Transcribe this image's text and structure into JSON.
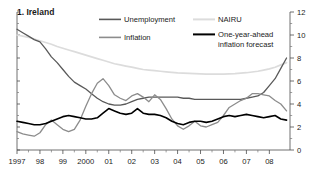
{
  "title": "1. Ireland",
  "legend": {
    "items": [
      {
        "label": "Unemployment",
        "color": "#595959",
        "width": 1.5
      },
      {
        "label": "Inflation",
        "color": "#8c8c8c",
        "width": 1.5
      },
      {
        "label": "NAIRU",
        "color": "#dcdcdc",
        "width": 1.6
      },
      {
        "label": "One-year-ahead",
        "color": "#000000",
        "width": 1.8
      },
      {
        "label": "inflation forecast",
        "color": "#000000",
        "width": 0
      }
    ]
  },
  "axes": {
    "y_right_labels": [
      "12",
      "10",
      "8",
      "6",
      "4",
      "2",
      "0"
    ],
    "y_right_values": [
      12,
      10,
      8,
      6,
      4,
      2,
      0
    ],
    "y_minor_values": [
      11,
      9,
      7,
      5,
      3,
      1
    ],
    "x_labels": [
      "1997",
      "98",
      "99",
      "2000",
      "01",
      "02",
      "03",
      "04",
      "05",
      "06",
      "07",
      "08"
    ]
  },
  "chart_data": {
    "type": "line",
    "title": "1. Ireland",
    "xlabel": "",
    "ylabel": "",
    "ylim": [
      0,
      12
    ],
    "xlim": [
      1997.0,
      2008.9
    ],
    "grid": false,
    "legend_position": "top",
    "x": [
      1997.0,
      1997.25,
      1997.5,
      1997.75,
      1998.0,
      1998.25,
      1998.5,
      1998.75,
      1999.0,
      1999.25,
      1999.5,
      1999.75,
      2000.0,
      2000.25,
      2000.5,
      2000.75,
      2001.0,
      2001.25,
      2001.5,
      2001.75,
      2002.0,
      2002.25,
      2002.5,
      2002.75,
      2003.0,
      2003.25,
      2003.5,
      2003.75,
      2004.0,
      2004.25,
      2004.5,
      2004.75,
      2005.0,
      2005.25,
      2005.5,
      2005.75,
      2006.0,
      2006.25,
      2006.5,
      2006.75,
      2007.0,
      2007.25,
      2007.5,
      2007.75,
      2008.0,
      2008.25,
      2008.5,
      2008.75
    ],
    "x_tick_values": [
      1997,
      1998,
      1999,
      2000,
      2001,
      2002,
      2003,
      2004,
      2005,
      2006,
      2007,
      2008
    ],
    "series": [
      {
        "name": "Unemployment",
        "color": "#595959",
        "values": [
          10.5,
          10.2,
          9.9,
          9.6,
          9.4,
          8.8,
          8.1,
          7.6,
          7.0,
          6.4,
          5.9,
          5.6,
          5.3,
          4.9,
          4.5,
          4.2,
          4.0,
          3.9,
          3.9,
          4.0,
          4.2,
          4.4,
          4.5,
          4.6,
          4.6,
          4.6,
          4.6,
          4.6,
          4.6,
          4.5,
          4.5,
          4.4,
          4.4,
          4.4,
          4.4,
          4.4,
          4.4,
          4.4,
          4.4,
          4.4,
          4.5,
          4.6,
          4.7,
          5.0,
          5.6,
          6.2,
          7.1,
          8.0
        ]
      },
      {
        "name": "Inflation",
        "color": "#8c8c8c",
        "values": [
          1.6,
          1.4,
          1.3,
          1.2,
          1.5,
          2.2,
          2.6,
          2.2,
          1.8,
          1.6,
          1.8,
          2.6,
          3.8,
          4.9,
          5.8,
          6.2,
          5.6,
          4.8,
          4.5,
          4.3,
          4.7,
          4.9,
          4.6,
          4.2,
          4.8,
          4.4,
          3.6,
          2.7,
          2.1,
          1.8,
          2.1,
          2.5,
          2.1,
          2.0,
          2.2,
          2.4,
          3.0,
          3.7,
          4.0,
          4.3,
          4.5,
          4.9,
          4.9,
          4.8,
          4.7,
          4.3,
          4.0,
          3.4
        ]
      },
      {
        "name": "NAIRU",
        "color": "#dcdcdc",
        "values": [
          10.0,
          9.9,
          9.8,
          9.65,
          9.5,
          9.35,
          9.2,
          9.0,
          8.85,
          8.7,
          8.55,
          8.4,
          8.25,
          8.1,
          7.95,
          7.8,
          7.65,
          7.5,
          7.4,
          7.3,
          7.2,
          7.1,
          7.0,
          6.95,
          6.9,
          6.85,
          6.8,
          6.75,
          6.7,
          6.68,
          6.66,
          6.64,
          6.62,
          6.6,
          6.6,
          6.6,
          6.6,
          6.62,
          6.64,
          6.68,
          6.72,
          6.78,
          6.85,
          6.95,
          7.05,
          7.2,
          7.4,
          7.6
        ]
      },
      {
        "name": "One-year-ahead inflation forecast",
        "color": "#000000",
        "values": [
          2.5,
          2.4,
          2.3,
          2.2,
          2.2,
          2.3,
          2.5,
          2.7,
          2.9,
          3.0,
          2.9,
          2.8,
          2.7,
          2.7,
          2.8,
          3.2,
          3.6,
          3.4,
          3.2,
          3.1,
          3.2,
          3.6,
          3.2,
          3.1,
          3.1,
          3.0,
          2.8,
          2.5,
          2.3,
          2.2,
          2.4,
          2.5,
          2.5,
          2.4,
          2.5,
          2.7,
          2.9,
          3.0,
          2.9,
          3.0,
          3.1,
          3.0,
          2.9,
          2.8,
          2.9,
          3.0,
          2.7,
          2.6
        ]
      }
    ]
  }
}
